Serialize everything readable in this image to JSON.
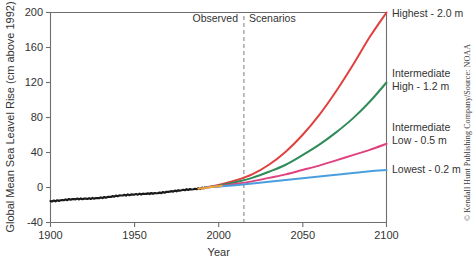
{
  "credit": "© Kendall Hunt Publishing Company/Source: NOAA",
  "annotations": {
    "observed": "Observed",
    "scenarios": "Scenarios",
    "divider_year": 2015
  },
  "chart_data": {
    "type": "line",
    "title": "",
    "xlabel": "Year",
    "ylabel": "Global Mean Sea Leavel Rise (cm above 1992)",
    "xlim": [
      1900,
      2100
    ],
    "ylim": [
      -40,
      200
    ],
    "xticks": [
      1900,
      1950,
      2000,
      2050,
      2100
    ],
    "xticklabels": [
      "1900",
      "1950",
      "2000",
      "2050",
      "2100"
    ],
    "yticks": [
      -40,
      0,
      40,
      80,
      120,
      160,
      200
    ],
    "yticklabels": [
      "-40",
      "0",
      "40",
      "80",
      "120",
      "160",
      "200"
    ],
    "grid": false,
    "legend_position": "right-inline",
    "series": [
      {
        "name": "Observed",
        "color": "#1a1a1a",
        "label": "",
        "x": [
          1900,
          1905,
          1910,
          1915,
          1920,
          1925,
          1930,
          1935,
          1940,
          1945,
          1950,
          1955,
          1960,
          1965,
          1970,
          1975,
          1980,
          1985,
          1990,
          1992
        ],
        "values": [
          -15.5,
          -15.0,
          -14.2,
          -13.5,
          -13.0,
          -12.2,
          -11.4,
          -10.6,
          -9.6,
          -9.0,
          -8.2,
          -7.4,
          -6.6,
          -5.8,
          -4.8,
          -4.0,
          -3.0,
          -2.2,
          -1.0,
          0.0
        ]
      },
      {
        "name": "Highest",
        "color": "#e0413f",
        "label": "Highest - 2.0 m",
        "x": [
          1992,
          2000,
          2010,
          2020,
          2030,
          2040,
          2050,
          2060,
          2070,
          2080,
          2090,
          2100
        ],
        "values": [
          0,
          3,
          8,
          15,
          26,
          41,
          60,
          83,
          110,
          140,
          172,
          200
        ]
      },
      {
        "name": "Intermediate High",
        "color": "#2f8b58",
        "label": "Intermediate\nHigh - 1.2 m",
        "x": [
          1992,
          2000,
          2010,
          2020,
          2030,
          2040,
          2050,
          2060,
          2070,
          2080,
          2090,
          2100
        ],
        "values": [
          0,
          2,
          6,
          11,
          18,
          26,
          37,
          49,
          63,
          79,
          98,
          120
        ]
      },
      {
        "name": "Intermediate Low",
        "color": "#e0417f",
        "label": "Intermediate\nLow - 0.5 m",
        "x": [
          1992,
          2000,
          2010,
          2020,
          2030,
          2040,
          2050,
          2060,
          2070,
          2080,
          2090,
          2100
        ],
        "values": [
          0,
          1.5,
          4,
          7,
          11,
          15,
          20,
          25,
          31,
          37,
          43,
          50
        ]
      },
      {
        "name": "Lowest",
        "color": "#4a9ede",
        "label": "Lowest - 0.2 m",
        "x": [
          1992,
          2000,
          2010,
          2020,
          2030,
          2040,
          2050,
          2060,
          2070,
          2080,
          2090,
          2100
        ],
        "values": [
          0,
          1,
          2.5,
          4.5,
          6.5,
          8.5,
          10.5,
          12.5,
          14.5,
          16.5,
          18.5,
          20
        ]
      }
    ],
    "series_labels": [
      {
        "text": "Highest - 2.0 m",
        "at_value": 200
      },
      {
        "text": "Intermediate",
        "at_value": 130
      },
      {
        "text": "High - 1.2 m",
        "at_value": 118
      },
      {
        "text": "Intermediate",
        "at_value": 62
      },
      {
        "text": "Low - 0.5 m",
        "at_value": 50
      },
      {
        "text": "Lowest - 0.2 m",
        "at_value": 22
      }
    ]
  }
}
